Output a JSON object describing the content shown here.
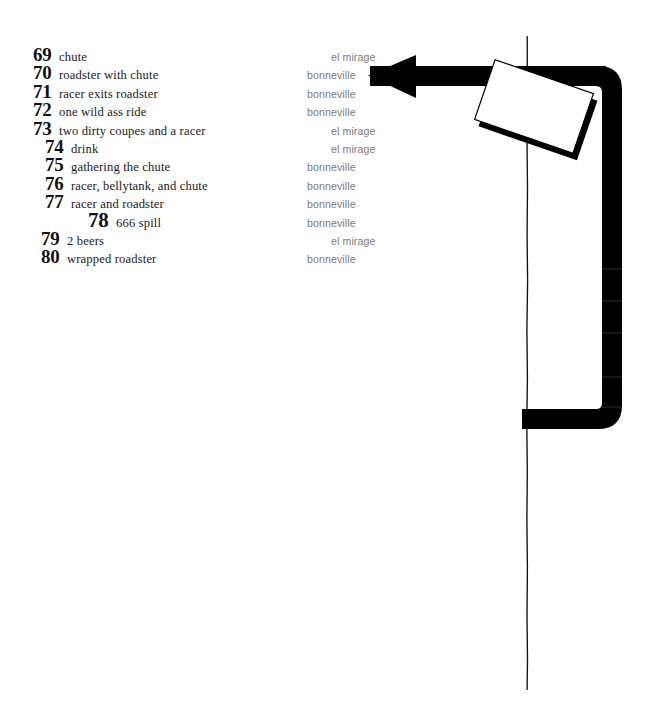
{
  "page": {
    "background_color": "#ffffff",
    "number_color": "#111111",
    "title_color": "#1a1a1a",
    "location_color": "#7c7c7c",
    "artwork_color": "#000000"
  },
  "index": {
    "entries": [
      {
        "number": "69",
        "title": "chute",
        "location": "el mirage"
      },
      {
        "number": "70",
        "title": "roadster with chute",
        "location": "bonneville"
      },
      {
        "number": "71",
        "title": "racer exits roadster",
        "location": "bonneville"
      },
      {
        "number": "72",
        "title": "one wild ass ride",
        "location": "bonneville"
      },
      {
        "number": "73",
        "title": "two dirty coupes and a racer",
        "location": "el mirage"
      },
      {
        "number": "74",
        "title": "drink",
        "location": "el mirage"
      },
      {
        "number": "75",
        "title": "gathering the chute",
        "location": "bonneville"
      },
      {
        "number": "76",
        "title": "racer, bellytank, and chute",
        "location": "bonneville"
      },
      {
        "number": "77",
        "title": "racer and roadster",
        "location": "bonneville"
      },
      {
        "number": "78",
        "title": "666 spill",
        "location": "bonneville"
      },
      {
        "number": "79",
        "title": "2 beers",
        "location": "el mirage"
      },
      {
        "number": "80",
        "title": "wrapped roadster",
        "location": "bonneville"
      }
    ]
  },
  "artwork": {
    "arrow_label": "left-pointing-arrow",
    "bracket_label": "rounded-bracket-bar",
    "card_label": "tilted-white-card",
    "line_label": "thin-vertical-line"
  }
}
